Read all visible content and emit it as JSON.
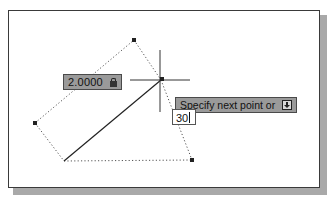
{
  "drawing": {
    "vertices": {
      "top": [
        134,
        40
      ],
      "crosshair_center": [
        161,
        80
      ],
      "left": [
        35,
        123
      ],
      "line_start": [
        64,
        161
      ],
      "bottom_right": [
        192,
        160
      ]
    },
    "colors": {
      "tooltip_bg": "#9a9a9a",
      "line": "#222222",
      "dotted": "#555555"
    }
  },
  "dimension_input": {
    "value": "2.0000",
    "icon": "lock-icon"
  },
  "command_prompt": {
    "text": "Specify next point or",
    "icon": "down-arrow-icon"
  },
  "angle_input": {
    "value": "30"
  }
}
